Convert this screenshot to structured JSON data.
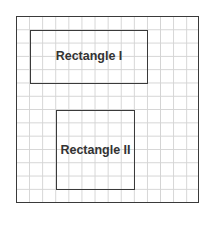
{
  "diagram": {
    "outer_box": {
      "grid": true
    },
    "rectangles": [
      {
        "label": "Rectangle I"
      },
      {
        "label": "Rectangle II"
      }
    ]
  }
}
